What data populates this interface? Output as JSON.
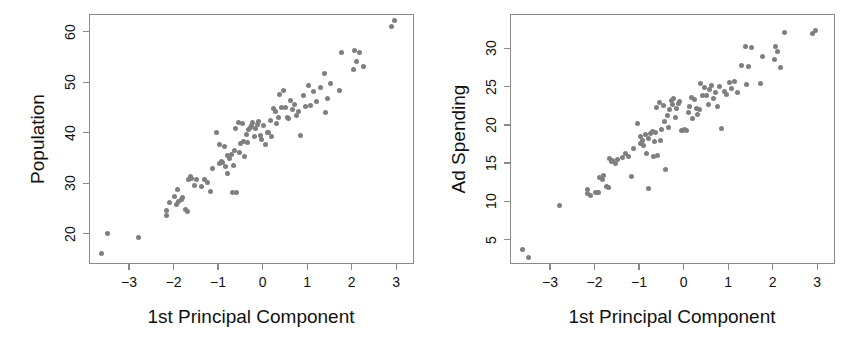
{
  "figure": {
    "background": "#ffffff",
    "point_color": "#7f7f7f",
    "axis_color": "#8a8a8a",
    "text_color": "#111111"
  },
  "chart_data": [
    {
      "type": "scatter",
      "panel": "left",
      "title": "",
      "xlabel": "1st Principal Component",
      "ylabel": "Population",
      "xlim": [
        -3.9,
        3.4
      ],
      "ylim": [
        14.0,
        63.5
      ],
      "xticks": [
        -3,
        -2,
        -1,
        0,
        1,
        2,
        3
      ],
      "xticklabels": [
        "−3",
        "−2",
        "−1",
        "0",
        "1",
        "2",
        "3"
      ],
      "yticks": [
        20,
        30,
        40,
        50,
        60
      ],
      "yticklabels": [
        "20",
        "30",
        "40",
        "50",
        "60"
      ],
      "grid": false,
      "legend": "none",
      "marker": "filled-circle",
      "n_points": 100,
      "x": [
        -3.63,
        -3.49,
        -2.79,
        -2.17,
        -2.15,
        -2.09,
        -1.99,
        -1.94,
        -1.92,
        -1.88,
        -1.82,
        -1.79,
        -1.74,
        -1.69,
        -1.66,
        -1.62,
        -1.59,
        -1.52,
        -1.49,
        -1.38,
        -1.31,
        -1.24,
        -1.18,
        -1.12,
        -1.04,
        -0.98,
        -0.96,
        -0.93,
        -0.9,
        -0.86,
        -0.83,
        -0.8,
        -0.78,
        -0.74,
        -0.71,
        -0.68,
        -0.66,
        -0.63,
        -0.6,
        -0.58,
        -0.55,
        -0.52,
        -0.49,
        -0.46,
        -0.43,
        -0.4,
        -0.37,
        -0.34,
        -0.31,
        -0.28,
        -0.25,
        -0.22,
        -0.19,
        -0.15,
        -0.12,
        -0.09,
        -0.05,
        -0.02,
        0.02,
        0.06,
        0.1,
        0.14,
        0.17,
        0.2,
        0.24,
        0.28,
        0.31,
        0.35,
        0.39,
        0.43,
        0.47,
        0.51,
        0.55,
        0.59,
        0.63,
        0.67,
        0.72,
        0.76,
        0.81,
        0.86,
        0.91,
        0.96,
        1.02,
        1.08,
        1.15,
        1.22,
        1.3,
        1.38,
        1.42,
        1.46,
        1.52,
        1.72,
        1.78,
        2.03,
        2.07,
        2.11,
        2.18,
        2.27,
        2.9,
        2.96
      ],
      "y": [
        16.0,
        20.0,
        19.3,
        23.6,
        24.6,
        26.2,
        27.3,
        25.8,
        28.8,
        26.4,
        26.8,
        27.1,
        24.8,
        24.4,
        30.8,
        31.3,
        31.0,
        29.6,
        30.8,
        29.3,
        30.7,
        30.2,
        28.4,
        33.0,
        40.0,
        37.7,
        33.9,
        34.3,
        34.1,
        37.2,
        33.3,
        35.5,
        31.9,
        34.8,
        35.6,
        28.2,
        33.5,
        36.5,
        40.9,
        28.1,
        42.1,
        36.0,
        37.9,
        41.9,
        38.2,
        35.2,
        39.7,
        38.1,
        40.6,
        41.1,
        41.5,
        42.0,
        39.2,
        40.8,
        41.6,
        42.2,
        39.5,
        38.6,
        41.4,
        37.7,
        40.0,
        40.1,
        42.5,
        39.3,
        44.7,
        44.2,
        41.8,
        43.0,
        47.5,
        44.9,
        48.3,
        45.0,
        43.1,
        42.8,
        46.4,
        44.6,
        45.6,
        43.5,
        44.1,
        39.4,
        47.3,
        45.2,
        49.3,
        45.4,
        48.2,
        46.1,
        49.0,
        51.7,
        44.0,
        46.8,
        49.7,
        48.4,
        55.8,
        52.5,
        56.2,
        54.0,
        55.9,
        53.2,
        61.0,
        62.2
      ]
    },
    {
      "type": "scatter",
      "panel": "right",
      "title": "",
      "xlabel": "1st Principal Component",
      "ylabel": "Ad Spending",
      "xlim": [
        -3.9,
        3.4
      ],
      "ylim": [
        1.8,
        34.5
      ],
      "xticks": [
        -3,
        -2,
        -1,
        0,
        1,
        2,
        3
      ],
      "xticklabels": [
        "−3",
        "−2",
        "−1",
        "0",
        "1",
        "2",
        "3"
      ],
      "yticks": [
        5,
        10,
        15,
        20,
        25,
        30
      ],
      "yticklabels": [
        "5",
        "10",
        "15",
        "20",
        "25",
        "30"
      ],
      "grid": false,
      "legend": "none",
      "marker": "filled-circle",
      "n_points": 100,
      "x": [
        -3.63,
        -3.49,
        -2.79,
        -2.17,
        -2.15,
        -2.09,
        -1.99,
        -1.94,
        -1.92,
        -1.88,
        -1.82,
        -1.79,
        -1.74,
        -1.69,
        -1.66,
        -1.62,
        -1.59,
        -1.52,
        -1.49,
        -1.38,
        -1.31,
        -1.24,
        -1.18,
        -1.12,
        -1.04,
        -0.98,
        -0.96,
        -0.93,
        -0.9,
        -0.86,
        -0.83,
        -0.8,
        -0.78,
        -0.74,
        -0.71,
        -0.68,
        -0.66,
        -0.63,
        -0.6,
        -0.58,
        -0.55,
        -0.52,
        -0.49,
        -0.46,
        -0.43,
        -0.4,
        -0.37,
        -0.34,
        -0.31,
        -0.28,
        -0.25,
        -0.22,
        -0.19,
        -0.15,
        -0.12,
        -0.09,
        -0.05,
        -0.02,
        0.02,
        0.06,
        0.1,
        0.14,
        0.17,
        0.2,
        0.24,
        0.28,
        0.31,
        0.35,
        0.39,
        0.43,
        0.47,
        0.51,
        0.55,
        0.59,
        0.63,
        0.67,
        0.72,
        0.76,
        0.81,
        0.86,
        0.91,
        0.96,
        1.02,
        1.08,
        1.15,
        1.22,
        1.3,
        1.38,
        1.42,
        1.46,
        1.52,
        1.72,
        1.78,
        2.03,
        2.07,
        2.11,
        2.18,
        2.27,
        2.9,
        2.96
      ],
      "y": [
        3.7,
        2.6,
        9.5,
        11.6,
        11.0,
        10.8,
        11.2,
        11.1,
        11.2,
        13.1,
        12.8,
        13.4,
        12.0,
        11.8,
        15.6,
        15.2,
        15.3,
        14.9,
        15.5,
        15.7,
        16.3,
        15.9,
        13.3,
        16.9,
        20.2,
        18.5,
        17.6,
        17.9,
        17.3,
        18.8,
        16.2,
        18.2,
        11.7,
        18.9,
        19.1,
        15.8,
        17.8,
        19.0,
        22.3,
        16.0,
        22.9,
        18.0,
        19.4,
        22.5,
        20.4,
        14.2,
        21.2,
        19.6,
        22.0,
        23.2,
        22.6,
        23.4,
        21.0,
        22.1,
        22.8,
        23.0,
        19.3,
        19.2,
        19.4,
        19.3,
        21.6,
        22.4,
        23.6,
        20.8,
        23.3,
        22.2,
        21.4,
        22.0,
        25.4,
        23.8,
        24.9,
        23.9,
        22.7,
        24.6,
        25.1,
        23.5,
        24.2,
        22.4,
        25.0,
        19.5,
        24.3,
        24.0,
        25.5,
        24.8,
        25.7,
        24.2,
        27.7,
        30.2,
        25.3,
        27.6,
        30.1,
        25.4,
        29.0,
        28.6,
        30.2,
        29.6,
        27.5,
        32.1,
        32.0,
        32.4
      ]
    }
  ]
}
